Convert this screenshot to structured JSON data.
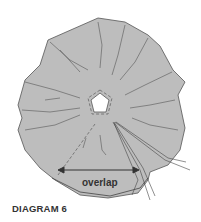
{
  "diagram": {
    "caption": "DIAGRAM 6",
    "annotation": "overlap",
    "colors": {
      "fabric_fill": "#bdbdbd",
      "outline": "#555555",
      "center_hole": "#ffffff",
      "text": "#333333"
    }
  }
}
